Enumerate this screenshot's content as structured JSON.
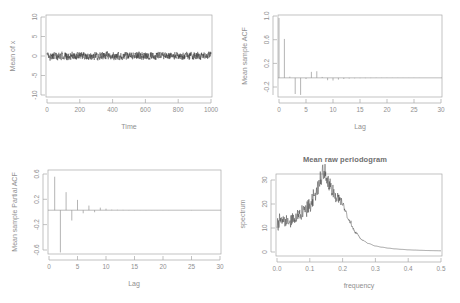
{
  "figure": {
    "background": "#ffffff",
    "axis_color": "#a8a8a8",
    "text_color": "#8f8f8f",
    "series_color": "#3a3a3a",
    "layout": "2x2 grid of R base-graphics panels"
  },
  "panels": {
    "timeseries": {
      "title": "",
      "ylabel": "Mean of x",
      "xlabel": "Time",
      "ytick_labels": [
        "10",
        "5",
        "0",
        "-5",
        "-10"
      ],
      "xtick_labels": [
        "0",
        "200",
        "400",
        "600",
        "800",
        "1000"
      ]
    },
    "acf": {
      "title": "",
      "ylabel": "Mean sample ACF",
      "xlabel": "Lag",
      "ytick_labels": [
        "1.0",
        "0.6",
        "0.2",
        "-0.2"
      ],
      "xtick_labels": [
        "0",
        "5",
        "10",
        "15",
        "20",
        "25",
        "30"
      ]
    },
    "pacf": {
      "title": "",
      "ylabel": "Mean sample Partial ACF",
      "xlabel": "Lag",
      "ytick_labels": [
        "0.6",
        "0.2",
        "-0.2",
        "-0.6"
      ],
      "xtick_labels": [
        "0",
        "5",
        "10",
        "15",
        "20",
        "25",
        "30"
      ]
    },
    "periodogram": {
      "title": "Mean raw periodogram",
      "ylabel": "spectrum",
      "xlabel": "frequency",
      "ytick_labels": [
        "0",
        "10",
        "20",
        "30"
      ],
      "xtick_labels": [
        "0.0",
        "0.1",
        "0.2",
        "0.3",
        "0.4",
        "0.5"
      ]
    }
  },
  "chart_data": [
    {
      "id": "timeseries",
      "type": "line",
      "title": "",
      "xlabel": "Time",
      "ylabel": "Mean of x",
      "xlim": [
        0,
        1000
      ],
      "ylim": [
        -12,
        12
      ],
      "xticks": [
        0,
        200,
        400,
        600,
        800,
        1000
      ],
      "yticks": [
        -10,
        -5,
        0,
        5,
        10
      ],
      "grid": false,
      "note": "Dense high-frequency noise oscillating tightly about 0 (amplitude roughly +-0.9) across the whole time range",
      "noise_amplitude": 0.9,
      "n_points": 1000
    },
    {
      "id": "acf",
      "type": "bar",
      "title": "",
      "xlabel": "Lag",
      "ylabel": "Mean sample ACF",
      "xlim": [
        0,
        30
      ],
      "ylim": [
        -0.32,
        1.05
      ],
      "xticks": [
        0,
        5,
        10,
        15,
        20,
        25,
        30
      ],
      "yticks": [
        -0.2,
        0.2,
        0.6,
        1.0
      ],
      "grid": false,
      "categories": [
        0,
        1,
        2,
        3,
        4,
        5,
        6,
        7,
        8,
        9,
        10,
        11,
        12,
        13,
        14,
        15,
        16,
        17,
        18,
        19,
        20,
        21,
        22,
        23,
        24,
        25,
        26,
        27,
        28,
        29,
        30
      ],
      "values": [
        1.0,
        0.65,
        0.02,
        -0.27,
        -0.285,
        -0.02,
        0.1,
        0.11,
        0.015,
        -0.04,
        -0.045,
        -0.03,
        -0.02,
        -0.012,
        -0.008,
        -0.006,
        -0.005,
        -0.004,
        -0.003,
        -0.003,
        -0.002,
        -0.002,
        -0.002,
        -0.001,
        -0.001,
        -0.001,
        -0.001,
        0.0,
        0.0,
        0.0,
        0.0
      ]
    },
    {
      "id": "pacf",
      "type": "bar",
      "title": "",
      "xlabel": "Lag",
      "ylabel": "Mean sample Partial ACF",
      "xlim": [
        0,
        30
      ],
      "ylim": [
        -0.85,
        0.78
      ],
      "xticks": [
        0,
        5,
        10,
        15,
        20,
        25,
        30
      ],
      "yticks": [
        -0.6,
        -0.2,
        0.2,
        0.6
      ],
      "grid": false,
      "categories": [
        1,
        2,
        3,
        4,
        5,
        6,
        7,
        8,
        9,
        10,
        11,
        12,
        13,
        14,
        15,
        16,
        17,
        18,
        19,
        20,
        21,
        22,
        23,
        24,
        25,
        26,
        27,
        28,
        29,
        30
      ],
      "values": [
        0.65,
        -0.82,
        0.35,
        -0.2,
        0.2,
        -0.06,
        0.09,
        -0.04,
        0.05,
        0.03,
        0.01,
        0.008,
        0.006,
        0.004,
        0.003,
        0.002,
        0.002,
        0.001,
        0.001,
        0.001,
        0.001,
        0.0,
        0.0,
        0.0,
        0.004,
        0.0,
        0.0,
        0.0,
        0.0,
        0.0
      ]
    },
    {
      "id": "periodogram",
      "type": "line",
      "title": "Mean raw periodogram",
      "xlabel": "frequency",
      "ylabel": "spectrum",
      "xlim": [
        0.0,
        0.5
      ],
      "ylim": [
        0,
        36
      ],
      "xticks": [
        0.0,
        0.1,
        0.2,
        0.3,
        0.4,
        0.5
      ],
      "yticks": [
        0,
        10,
        20,
        30
      ],
      "grid": false,
      "peak_frequency": 0.14,
      "peak_spectrum": 35,
      "x": [
        0.0,
        0.02,
        0.04,
        0.06,
        0.08,
        0.1,
        0.12,
        0.14,
        0.16,
        0.18,
        0.2,
        0.22,
        0.24,
        0.26,
        0.28,
        0.3,
        0.32,
        0.34,
        0.36,
        0.38,
        0.4,
        0.42,
        0.44,
        0.46,
        0.48,
        0.5
      ],
      "y": [
        12.0,
        13.0,
        13.5,
        14.5,
        16.5,
        19.5,
        25.0,
        33.0,
        28.0,
        23.5,
        20.0,
        13.0,
        8.0,
        5.0,
        3.5,
        2.5,
        2.0,
        1.6,
        1.3,
        1.1,
        0.9,
        0.8,
        0.7,
        0.6,
        0.55,
        0.5
      ]
    }
  ]
}
